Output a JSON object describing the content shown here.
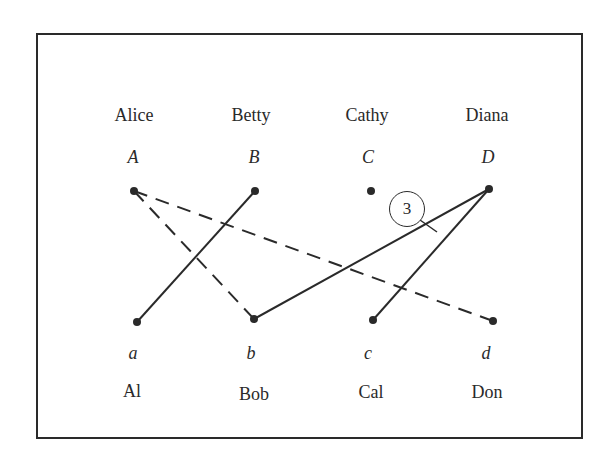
{
  "diagram": {
    "type": "bipartite-matching-graph",
    "top_people": [
      {
        "name": "Alice",
        "var": "A",
        "x": 134
      },
      {
        "name": "Betty",
        "var": "B",
        "x": 255
      },
      {
        "name": "Cathy",
        "var": "C",
        "x": 371
      },
      {
        "name": "Diana",
        "var": "D",
        "x": 489
      }
    ],
    "bottom_people": [
      {
        "name": "Al",
        "var": "a",
        "x": 137
      },
      {
        "name": "Bob",
        "var": "b",
        "x": 254
      },
      {
        "name": "Cal",
        "var": "c",
        "x": 373
      },
      {
        "name": "Don",
        "var": "d",
        "x": 493
      }
    ],
    "edges": [
      {
        "from": "A",
        "to": "b",
        "style": "dashed"
      },
      {
        "from": "A",
        "to": "d",
        "style": "dashed"
      },
      {
        "from": "B",
        "to": "a",
        "style": "solid"
      },
      {
        "from": "D",
        "to": "b",
        "style": "solid"
      },
      {
        "from": "D",
        "to": "c",
        "style": "solid"
      }
    ],
    "callout": {
      "label": "3",
      "points_to": "edge D-b"
    },
    "colors": {
      "ink": "#2a2a2a",
      "background": "#ffffff"
    }
  }
}
